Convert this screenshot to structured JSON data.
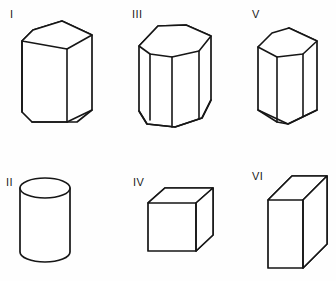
{
  "figure": {
    "background_color": "#fefefe",
    "stroke_color": "#161616",
    "face_color": "#ffffff",
    "width": 336,
    "height": 281,
    "items": [
      {
        "id": "I",
        "label": "I",
        "shape_name": "pentagonal-prism",
        "shape_description": "Pentagonal prism drawn in oblique view, tall, upright",
        "label_x": 10,
        "label_y": 9,
        "row": "top",
        "column": 1
      },
      {
        "id": "II",
        "label": "II",
        "shape_name": "cylinder",
        "shape_description": "Right circular cylinder with elliptical top, upright",
        "label_x": 6,
        "label_y": 177,
        "row": "bottom",
        "column": 1
      },
      {
        "id": "III",
        "label": "III",
        "shape_name": "octagonal-prism",
        "shape_description": "Octagonal prism drawn in oblique view, upright",
        "label_x": 132,
        "label_y": 9,
        "row": "top",
        "column": 2
      },
      {
        "id": "IV",
        "label": "IV",
        "shape_name": "cube",
        "shape_description": "Cube drawn in oblique view",
        "label_x": 133,
        "label_y": 177,
        "row": "bottom",
        "column": 2
      },
      {
        "id": "V",
        "label": "V",
        "shape_name": "hexagonal-prism",
        "shape_description": "Hexagonal prism drawn in oblique view, upright",
        "label_x": 252,
        "label_y": 9,
        "row": "top",
        "column": 3
      },
      {
        "id": "VI",
        "label": "VI",
        "shape_name": "rectangular-prism",
        "shape_description": "Rectangular prism (cuboid) drawn in oblique view, tall and narrow",
        "label_x": 252,
        "label_y": 171,
        "row": "bottom",
        "column": 3
      }
    ]
  }
}
